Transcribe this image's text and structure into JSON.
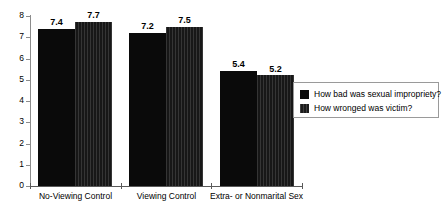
{
  "chart_data": {
    "type": "bar",
    "title": "",
    "subtitle": "",
    "xlabel": "",
    "ylabel": "",
    "ylim": [
      0,
      8
    ],
    "yticks": [
      "0",
      "1",
      "2",
      "3",
      "4",
      "5",
      "6",
      "7",
      "8"
    ],
    "grid": false,
    "legend_position": "right",
    "categories": [
      "No-Viewing Control",
      "Viewing Control",
      "Extra- or Nonmarital Sex"
    ],
    "series": [
      {
        "name": "How bad was sexual impropriety?",
        "color": "#0a0a0a",
        "values": [
          7.4,
          7.2,
          5.4
        ],
        "value_labels": [
          "7.4",
          "7.2",
          "5.4"
        ]
      },
      {
        "name": "How wronged was victim?",
        "color": "#171717",
        "values": [
          7.7,
          7.5,
          5.2
        ],
        "value_labels": [
          "7.7",
          "7.5",
          "5.2"
        ]
      }
    ]
  },
  "legend": {
    "items": [
      {
        "label": "How bad was sexual impropriety?"
      },
      {
        "label": "How wronged was victim?"
      }
    ]
  }
}
